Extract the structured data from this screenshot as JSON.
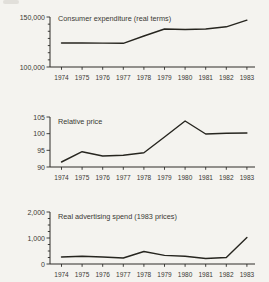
{
  "page": {
    "background_color": "#f4f3ef",
    "ink_color": "#2e2d29"
  },
  "chart_data": [
    {
      "type": "line",
      "title": "Consumer expenditure (real terms)",
      "categories": [
        "1974",
        "1975",
        "1976",
        "1977",
        "1978",
        "1979",
        "1980",
        "1981",
        "1982",
        "1983"
      ],
      "values": [
        124000,
        124000,
        123900,
        123700,
        131000,
        138000,
        137500,
        138000,
        140200,
        146800
      ],
      "xlabel": "",
      "ylabel": "",
      "ylim": [
        100000,
        150000
      ],
      "yticks": [
        {
          "value": 150000,
          "label": "150,000"
        },
        {
          "value": 100000,
          "label": "100,000"
        }
      ],
      "minor_tick_divisions": 7,
      "grid": false,
      "legend": "none"
    },
    {
      "type": "line",
      "title": "Relative price",
      "categories": [
        "1974",
        "1975",
        "1976",
        "1977",
        "1978",
        "1979",
        "1980",
        "1981",
        "1982",
        "1983"
      ],
      "values": [
        91.5,
        94.6,
        93.3,
        93.5,
        94.3,
        99.0,
        103.8,
        99.9,
        100.1,
        100.2
      ],
      "xlabel": "",
      "ylabel": "",
      "ylim": [
        90,
        105
      ],
      "yticks": [
        {
          "value": 105,
          "label": "105"
        },
        {
          "value": 100,
          "label": "100"
        },
        {
          "value": 95,
          "label": "95"
        },
        {
          "value": 90,
          "label": "90"
        }
      ],
      "minor_tick_divisions": 0,
      "grid": false,
      "legend": "none"
    },
    {
      "type": "line",
      "title": "Real advertising spend (1983 prices)",
      "categories": [
        "1974",
        "1975",
        "1976",
        "1977",
        "1978",
        "1979",
        "1980",
        "1981",
        "1982",
        "1983"
      ],
      "values": [
        270,
        300,
        270,
        230,
        480,
        330,
        300,
        210,
        250,
        1020
      ],
      "xlabel": "",
      "ylabel": "",
      "ylim": [
        0,
        2000
      ],
      "yticks": [
        {
          "value": 2000,
          "label": "2,000"
        },
        {
          "value": 1000,
          "label": "1,000"
        },
        {
          "value": 0,
          "label": "0"
        }
      ],
      "minor_tick_divisions": 8,
      "grid": false,
      "legend": "none"
    }
  ]
}
